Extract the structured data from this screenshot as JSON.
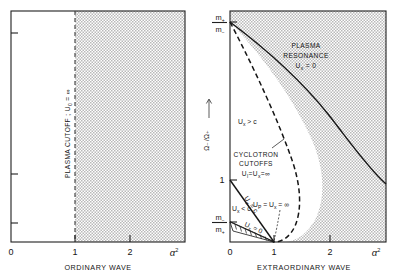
{
  "figure": {
    "kind": "plasma-wave-propagation-diagram",
    "panels": [
      {
        "id": "ordinary-wave",
        "title": "ORDINARY  WAVE",
        "x_axis_symbol": "α",
        "x_axis_exponent": "2",
        "x_ticks": [
          "0",
          "1",
          "2"
        ],
        "y_ticks": [
          "",
          "",
          ""
        ],
        "annotations": [
          {
            "id": "plasma-cutoff",
            "text": "PLASMA  CUTOFF ;  U",
            "sub": "0",
            "tail": " = ∞"
          }
        ],
        "regions": [
          {
            "id": "stop-band",
            "fill": "dotted-gray",
            "from_x": 1.0,
            "to_x": 2.8
          }
        ],
        "boundaries": [
          {
            "id": "plasma-cutoff-line",
            "style": "dashed-vertical",
            "x": 1.0
          }
        ]
      },
      {
        "id": "extraordinary-wave",
        "title": "EXTRAORDINARY  WAVE",
        "x_axis_symbol": "α",
        "x_axis_exponent": "2",
        "x_ticks": [
          "0",
          "1",
          "2"
        ],
        "y_axis_label": "Ω₋/Ω₊",
        "y_ticks": [
          {
            "id": "m-plus-over-m-minus",
            "num": "m",
            "num_sub": "+",
            "den": "m",
            "den_sub": "−"
          },
          {
            "id": "unity",
            "label": "1"
          },
          {
            "id": "m-minus-over-m-plus",
            "num": "m",
            "num_sub": "−",
            "den": "m",
            "den_sub": "+"
          }
        ],
        "annotations": [
          {
            "id": "plasma-resonance",
            "line1": "PLASMA",
            "line2": "RESONANCE",
            "line3_pre": "U",
            "line3_sub": "x",
            "line3_post": " = 0"
          },
          {
            "id": "cyclotron-cutoffs",
            "line1": "CYCLOTRON",
            "line2": "CUTOFFS",
            "line3_pre": "U",
            "line3_sub1": "l",
            "line3_mid": "=U",
            "line3_sub2": "x",
            "line3_post": "=∞"
          },
          {
            "id": "ux-greater-c",
            "pre": "U",
            "sub": "x",
            "post": " > c"
          },
          {
            "id": "ux-less-c",
            "pre": "U",
            "sub": "x",
            "post": " < c"
          },
          {
            "id": "ux-equals-c",
            "pre": "U",
            "sub": "x",
            "post": " = c"
          },
          {
            "id": "ux-equals-zero",
            "pre": "U",
            "sub": "x",
            "post": " = 0"
          },
          {
            "id": "up-equals-ux-infinite",
            "pre": "U",
            "sub1": "P",
            "mid": " = U",
            "sub2": "x",
            "post": " = ∞"
          }
        ],
        "regions": [
          {
            "id": "stop-band",
            "fill": "dotted-gray"
          },
          {
            "id": "hatched-sliver",
            "fill": "hatched-white"
          }
        ],
        "boundaries": [
          {
            "id": "plasma-resonance-curve",
            "style": "solid"
          },
          {
            "id": "cyclotron-cutoff-curve",
            "style": "dashed"
          },
          {
            "id": "ux-equals-c-line",
            "style": "solid"
          },
          {
            "id": "ux-equals-zero-line",
            "style": "solid"
          }
        ]
      }
    ],
    "colors": {
      "ink": "#151515",
      "shade": "#c9c9c9",
      "paper": "#ffffff"
    }
  }
}
